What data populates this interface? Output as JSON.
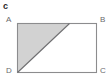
{
  "figure": {
    "label": "c",
    "shape": "rectangle-with-shaded-triangle",
    "background_color": "#ffffff",
    "stroke_color": "#8c8c8e",
    "shaded_fill_color": "#d2d2d2",
    "unshaded_fill_color": "#ffffff",
    "label_color": "#6a6a6c",
    "figure_label_color": "#2b2b2b"
  },
  "vertices": {
    "A": {
      "label": "A",
      "position": "top-left"
    },
    "B": {
      "label": "B",
      "position": "top-right"
    },
    "C": {
      "label": "C",
      "position": "bottom-right"
    },
    "D": {
      "label": "D",
      "position": "bottom-left"
    }
  },
  "geometry": {
    "rectangle": {
      "x": 17,
      "y": 23,
      "width": 80,
      "height": 50
    },
    "diagonal": {
      "from": "D",
      "to_point_on_top_edge_x": 69
    },
    "shaded_region": "triangle A-D-point-on-top-edge"
  }
}
